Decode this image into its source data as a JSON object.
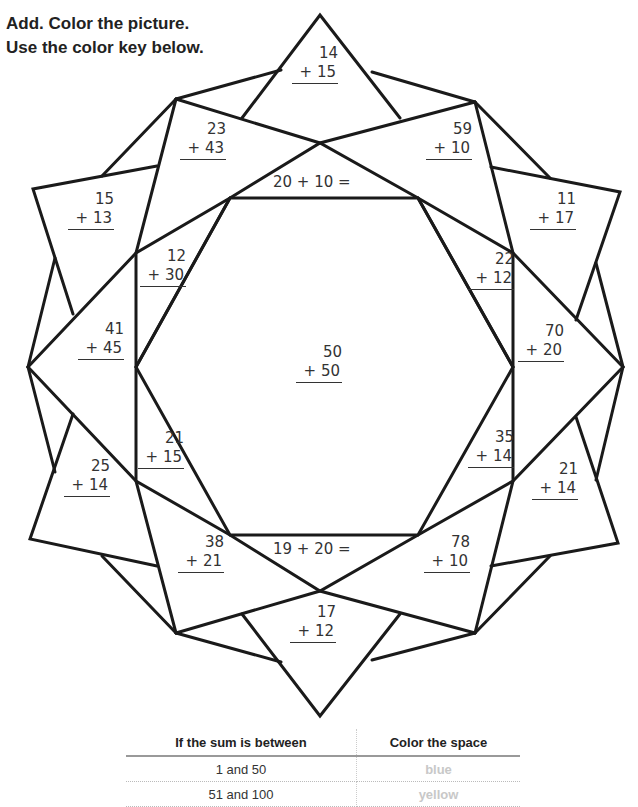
{
  "instructions": {
    "line1": "Add. Color the picture.",
    "line2": "Use the color key below."
  },
  "problems": [
    {
      "id": "top",
      "top": "14",
      "bottom": "+ 15",
      "x": 292,
      "y": 44
    },
    {
      "id": "upper-left-inner",
      "top": "23",
      "bottom": "+ 43",
      "x": 180,
      "y": 120
    },
    {
      "id": "upper-right-inner",
      "top": "59",
      "bottom": "+ 10",
      "x": 428,
      "y": 120
    },
    {
      "id": "far-upper-left",
      "top": "15",
      "bottom": "+ 13",
      "x": 68,
      "y": 190
    },
    {
      "id": "far-upper-right",
      "top": "11",
      "bottom": "+ 17",
      "x": 532,
      "y": 190
    },
    {
      "id": "left-upper-wedge",
      "top": "12",
      "bottom": "+ 30",
      "x": 140,
      "y": 247
    },
    {
      "id": "right-upper-wedge",
      "top": "22",
      "bottom": "+ 12",
      "x": 470,
      "y": 250
    },
    {
      "id": "left-point",
      "top": "41",
      "bottom": "+ 45",
      "x": 80,
      "y": 320
    },
    {
      "id": "right-point",
      "top": "70",
      "bottom": "+ 20",
      "x": 520,
      "y": 322
    },
    {
      "id": "center",
      "top": "50",
      "bottom": "+ 50",
      "x": 298,
      "y": 343
    },
    {
      "id": "left-lower-wedge",
      "top": "21",
      "bottom": "+ 15",
      "x": 138,
      "y": 430
    },
    {
      "id": "right-lower-wedge",
      "top": "35",
      "bottom": "+ 14",
      "x": 470,
      "y": 430
    },
    {
      "id": "far-lower-left",
      "top": "25",
      "bottom": "+ 14",
      "x": 66,
      "y": 458
    },
    {
      "id": "far-lower-right",
      "top": "21",
      "bottom": "+ 14",
      "x": 534,
      "y": 460
    },
    {
      "id": "lower-left-inner",
      "top": "38",
      "bottom": "+ 21",
      "x": 180,
      "y": 534
    },
    {
      "id": "lower-right-inner",
      "top": "78",
      "bottom": "+ 10",
      "x": 426,
      "y": 534
    },
    {
      "id": "bottom",
      "top": "17",
      "bottom": "+ 12",
      "x": 292,
      "y": 605
    }
  ],
  "equations": [
    {
      "id": "top-band",
      "text": "20 + 10 =",
      "x": 273,
      "y": 173
    },
    {
      "id": "bottom-band",
      "text": "19 + 20 =",
      "x": 273,
      "y": 540
    }
  ],
  "color_key": {
    "header_range": "If the sum is between",
    "header_color": "Color the space",
    "rows": [
      {
        "range": "1 and 50",
        "color": "blue"
      },
      {
        "range": "51 and 100",
        "color": "yellow"
      }
    ]
  }
}
